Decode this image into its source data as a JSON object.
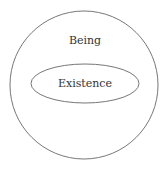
{
  "diagram": {
    "outer": {
      "label": "Being",
      "stroke": "#777777"
    },
    "inner": {
      "label": "Existence",
      "stroke": "#777777"
    }
  }
}
